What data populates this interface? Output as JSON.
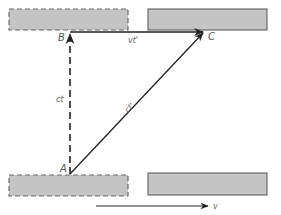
{
  "diagram": {
    "type": "light-clock-spacetime-diagram",
    "colors": {
      "mirror_fill": "#c4c4c4",
      "mirror_stroke": "#6a6a6a",
      "line": "#222222",
      "label": "#555555"
    },
    "points": {
      "A": {
        "label": "A",
        "x": 70,
        "y": 174
      },
      "B": {
        "label": "B",
        "x": 70,
        "y": 32
      },
      "C": {
        "label": "C",
        "x": 204,
        "y": 32
      }
    },
    "mirrors": [
      {
        "name": "top-left-mirror-initial",
        "style": "dashed",
        "x": 9,
        "y": 9,
        "w": 119,
        "h": 21
      },
      {
        "name": "top-right-mirror-moved",
        "style": "solid",
        "x": 148,
        "y": 9,
        "w": 119,
        "h": 21
      },
      {
        "name": "bottom-left-mirror-initial",
        "style": "dashed",
        "x": 9,
        "y": 175,
        "w": 119,
        "h": 21
      },
      {
        "name": "bottom-right-mirror-moved",
        "style": "solid",
        "x": 148,
        "y": 173,
        "w": 119,
        "h": 22
      }
    ],
    "edges": [
      {
        "name": "A-to-B",
        "label": "ct",
        "style": "dashed"
      },
      {
        "name": "B-to-C",
        "label": "vt'",
        "style": "solid"
      },
      {
        "name": "A-to-C",
        "label": "ct'",
        "style": "solid"
      }
    ],
    "velocity_arrow": {
      "label": "v"
    }
  }
}
